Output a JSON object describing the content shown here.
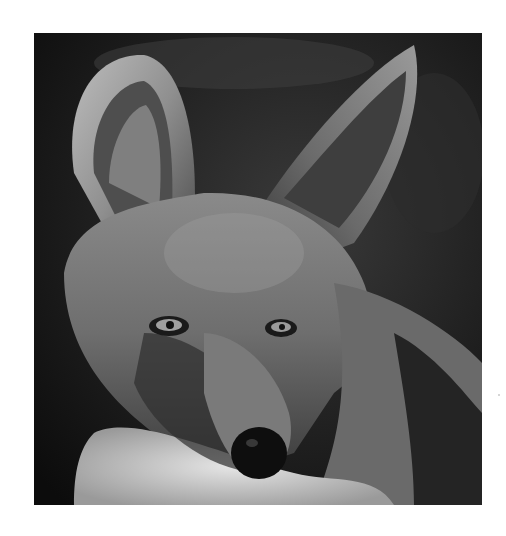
{
  "image": {
    "subject": "Black-backed jackal portrait (grayscale)",
    "style": "black-and-white photograph",
    "frame": {
      "left": 34,
      "top": 33,
      "width": 448,
      "height": 472
    },
    "background_color": "#ffffff"
  }
}
